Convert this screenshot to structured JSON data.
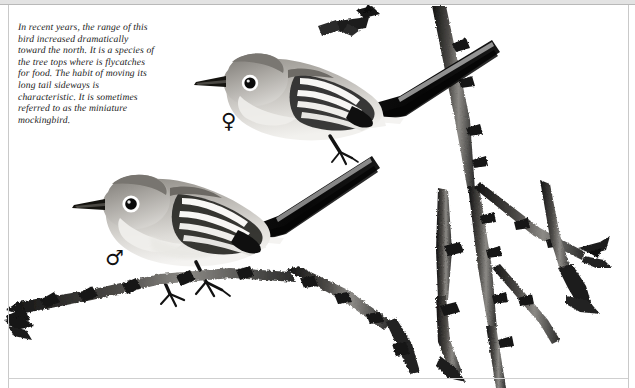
{
  "plate": {
    "caption": "In recent years, the range of this bird increased dramatically toward the north. It is a species of the tree tops where is flycatches for food. The habit of moving its long tail sideways is characteristic. It is sometimes referred to as the miniature mockingbird.",
    "caption_lines": [
      "In recent years, the range of this",
      "bird increased dramatically",
      "toward the north. It is a species of",
      "the tree tops where is flycatches",
      "for food. The habit of moving its",
      "long tail sideways is",
      "characteristic. It is sometimes",
      "referred to as the miniature",
      "mockingbird."
    ],
    "symbols": {
      "female": "♀",
      "male": "♂"
    },
    "subjects": [
      {
        "id": "upper-bird",
        "sex": "female",
        "symbol": "♀",
        "posture": "perched, facing left, long dark tail raised to upper right"
      },
      {
        "id": "lower-bird",
        "sex": "male",
        "symbol": "♂",
        "posture": "perched, facing left, long dark tail raised to upper right"
      }
    ],
    "colors": {
      "background": "#ffffff",
      "ink": "#1a1a1a",
      "frame": "#c9c9c9",
      "frame_top_band": "#e3e3e3",
      "bird_body_light": "#d8d5d0",
      "bird_body_mid": "#b3b0ab",
      "bird_body_dark": "#8d8a85",
      "bird_crown": "#7e7b76",
      "bird_breast": "#eceae6",
      "wing_dark": "#141414",
      "wing_bar": "#f6f5f3",
      "tail_black": "#0d0d0d",
      "eye_black": "#0a0a0a",
      "eyering_white": "#ffffff",
      "branch_dark": "#1d1d1d",
      "branch_mid": "#5e5c59",
      "branch_light": "#a9a7a3"
    }
  }
}
